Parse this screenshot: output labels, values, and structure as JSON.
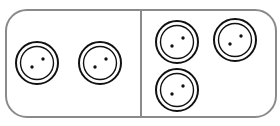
{
  "diagram": {
    "type": "coin-tray",
    "border_color": "#8a8a8a",
    "groups": [
      {
        "name": "left",
        "count": 2,
        "coins": [
          {
            "cx": 37,
            "cy": 63
          },
          {
            "cx": 100,
            "cy": 63
          }
        ]
      },
      {
        "name": "right",
        "count": 3,
        "coins": [
          {
            "cx": 177,
            "cy": 42
          },
          {
            "cx": 235,
            "cy": 40
          },
          {
            "cx": 177,
            "cy": 90
          }
        ]
      }
    ]
  }
}
